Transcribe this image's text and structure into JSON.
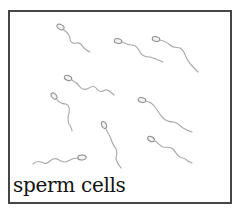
{
  "caption": "sperm cells",
  "colors": {
    "border": "#454545",
    "cell_outline": "#8a8a8a",
    "tail": "#a8a8a8",
    "caption_text": "#111111",
    "background": "#ffffff"
  },
  "cells": [
    {
      "name": "sperm-cell-1",
      "head": [
        61,
        27
      ],
      "direction": "down-right"
    },
    {
      "name": "sperm-cell-2",
      "head": [
        118,
        41
      ],
      "direction": "right"
    },
    {
      "name": "sperm-cell-3",
      "head": [
        156,
        39
      ],
      "direction": "down-right"
    },
    {
      "name": "sperm-cell-4",
      "head": [
        68,
        78
      ],
      "direction": "right"
    },
    {
      "name": "sperm-cell-5",
      "head": [
        54,
        96
      ],
      "direction": "down"
    },
    {
      "name": "sperm-cell-6",
      "head": [
        142,
        100
      ],
      "direction": "down-right"
    },
    {
      "name": "sperm-cell-7",
      "head": [
        104,
        125
      ],
      "direction": "down"
    },
    {
      "name": "sperm-cell-8",
      "head": [
        151,
        139
      ],
      "direction": "down-right"
    },
    {
      "name": "sperm-cell-9",
      "head": [
        82,
        158
      ],
      "direction": "left"
    }
  ]
}
